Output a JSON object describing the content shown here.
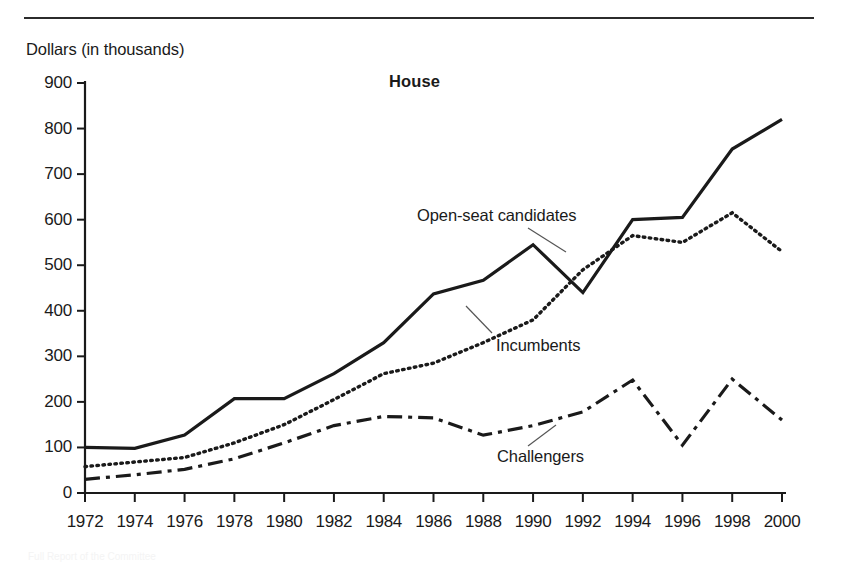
{
  "figure": {
    "top_rule": true,
    "axis_unit_label": "Dollars (in thousands)",
    "title": "House",
    "caption_partial": "Full Report of the Committee"
  },
  "annotations": [
    {
      "name": "open-seat",
      "text": "Open-seat candidates"
    },
    {
      "name": "incumbents",
      "text": "Incumbents"
    },
    {
      "name": "challengers",
      "text": "Challengers"
    }
  ],
  "chart_data": {
    "type": "line",
    "title": "House",
    "xlabel": "",
    "ylabel": "Dollars (in thousands)",
    "ylim": [
      0,
      900
    ],
    "ytick_step": 100,
    "yticks": [
      0,
      100,
      200,
      300,
      400,
      500,
      600,
      700,
      800,
      900
    ],
    "grid": false,
    "legend": "inline-annotations",
    "categories": [
      1972,
      1974,
      1976,
      1978,
      1980,
      1982,
      1984,
      1986,
      1988,
      1990,
      1992,
      1994,
      1996,
      1998,
      2000
    ],
    "xtick_labels": [
      "1972",
      "1974",
      "1976",
      "1978",
      "1980",
      "1982",
      "1984",
      "1986",
      "1988",
      "1990",
      "1992",
      "1994",
      "1996",
      "1998",
      "2000"
    ],
    "series": [
      {
        "name": "Open-seat candidates",
        "style": "solid",
        "color": "#1a1a1a",
        "values": [
          100,
          98,
          127,
          207,
          207,
          262,
          330,
          437,
          467,
          545,
          440,
          600,
          605,
          755,
          820
        ]
      },
      {
        "name": "Incumbents",
        "style": "dotted",
        "color": "#1a1a1a",
        "values": [
          58,
          68,
          78,
          110,
          150,
          205,
          262,
          285,
          330,
          380,
          490,
          565,
          550,
          615,
          530
        ]
      },
      {
        "name": "Challengers",
        "style": "dash-dot",
        "color": "#1a1a1a",
        "values": [
          30,
          40,
          52,
          75,
          110,
          148,
          168,
          165,
          127,
          148,
          178,
          248,
          105,
          250,
          160
        ]
      }
    ]
  }
}
